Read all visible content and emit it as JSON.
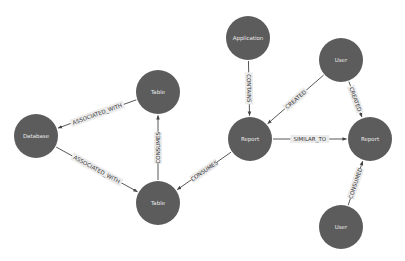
{
  "diagram": {
    "type": "graph",
    "colors": {
      "node_fill": "#5c5c5c",
      "node_text": "#e8e8e8",
      "edge": "#444444",
      "edge_label_bg": "#ececec",
      "edge_label_text": "#333333"
    },
    "nodes": [
      {
        "id": "application",
        "label": "Application"
      },
      {
        "id": "user_top",
        "label": "User"
      },
      {
        "id": "table_top",
        "label": "Table"
      },
      {
        "id": "database",
        "label": "Database"
      },
      {
        "id": "report_mid",
        "label": "Report"
      },
      {
        "id": "report_right",
        "label": "Report"
      },
      {
        "id": "table_bottom",
        "label": "Table"
      },
      {
        "id": "user_bottom",
        "label": "User"
      }
    ],
    "edges": [
      {
        "from": "application",
        "to": "report_mid",
        "label": "CONTAINS"
      },
      {
        "from": "user_top",
        "to": "report_mid",
        "label": "CREATED"
      },
      {
        "from": "user_top",
        "to": "report_right",
        "label": "CREATED"
      },
      {
        "from": "report_mid",
        "to": "report_right",
        "label": "SIMILAR_TO"
      },
      {
        "from": "report_mid",
        "to": "table_bottom",
        "label": "CONSUMES"
      },
      {
        "from": "table_bottom",
        "to": "table_top",
        "label": "CONSUMES"
      },
      {
        "from": "table_top",
        "to": "database",
        "label": "ASSOCIATED_WITH"
      },
      {
        "from": "database",
        "to": "table_bottom",
        "label": "ASSOCIATED_WITH"
      },
      {
        "from": "user_bottom",
        "to": "report_right",
        "label": "CONSUMED"
      }
    ]
  }
}
